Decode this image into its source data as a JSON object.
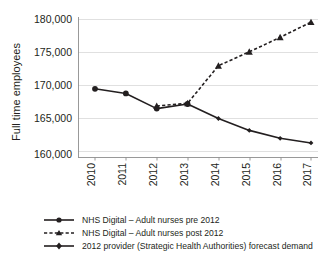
{
  "chart_data": {
    "type": "line",
    "title": "",
    "xlabel": "",
    "ylabel": "Full time employees",
    "categories": [
      "2010",
      "2011",
      "2012",
      "2013",
      "2014",
      "2015",
      "2016",
      "2017"
    ],
    "x": [
      2010,
      2011,
      2012,
      2013,
      2014,
      2015,
      2016,
      2017
    ],
    "ylim": [
      158000,
      180000
    ],
    "yticks": [
      160000,
      165000,
      170000,
      175000,
      180000
    ],
    "ytick_labels": [
      "160,000",
      "165,000",
      "170,000",
      "175,000",
      "180,000"
    ],
    "grid": true,
    "legend_position": "bottom",
    "series": [
      {
        "name": "NHS Digital – Adult nurses pre 2012",
        "style": "solid",
        "marker": "circle",
        "color": "#231f20",
        "x": [
          2010,
          2011,
          2012,
          2013
        ],
        "values": [
          169500,
          168800,
          166500,
          167200
        ]
      },
      {
        "name": "NHS Digital – Adult nurses post 2012",
        "style": "dashed",
        "marker": "triangle",
        "color": "#231f20",
        "x": [
          2012,
          2013,
          2014,
          2015,
          2016,
          2017
        ],
        "values": [
          166900,
          167300,
          173000,
          175100,
          177300,
          179600
        ]
      },
      {
        "name": "2012 provider (Strategic Health Authorities) forecast demand",
        "style": "solid",
        "marker": "diamond",
        "color": "#231f20",
        "x": [
          2013,
          2014,
          2015,
          2016,
          2017
        ],
        "values": [
          167200,
          165000,
          163200,
          162000,
          161300
        ]
      }
    ]
  },
  "axis": {
    "y_title": "Full time employees",
    "y_ticks": [
      "180,000",
      "175,000",
      "170,000",
      "165,000",
      "160,000"
    ],
    "x_ticks": [
      "2010",
      "2011",
      "2012",
      "2013",
      "2014",
      "2015",
      "2016",
      "2017"
    ]
  },
  "legend": {
    "items": [
      {
        "label": "NHS Digital – Adult nurses pre 2012",
        "marker": "circle-marker",
        "style": "solid"
      },
      {
        "label": "NHS Digital – Adult nurses post 2012",
        "marker": "triangle-marker",
        "style": "dashed"
      },
      {
        "label": "2012 provider (Strategic Health Authorities) forecast demand",
        "marker": "diamond-marker",
        "style": "solid"
      }
    ]
  },
  "colors": {
    "ink": "#231f20",
    "grid": "#d8d8d8",
    "axis": "#8d8d8d",
    "background": "#ffffff"
  }
}
